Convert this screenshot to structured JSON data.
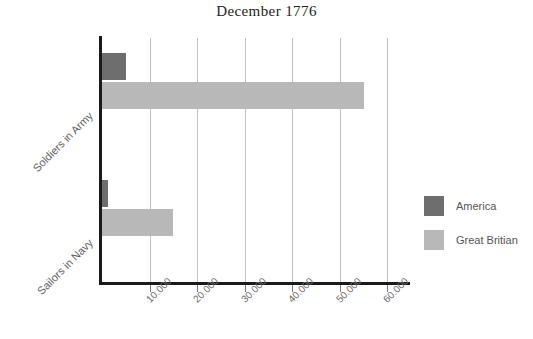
{
  "chart_data": {
    "type": "bar",
    "orientation": "horizontal",
    "title": "December 1776",
    "xlabel": "",
    "ylabel": "",
    "categories": [
      "Soldiers in Army",
      "Sailors in Navy"
    ],
    "series": [
      {
        "name": "America",
        "color": "#6e6e6e",
        "values": [
          5000,
          1200
        ]
      },
      {
        "name": "Great Britian",
        "color": "#b8b8b8",
        "values": [
          55000,
          15000
        ]
      }
    ],
    "xlim": [
      0,
      62000
    ],
    "xticks": [
      10000,
      20000,
      30000,
      40000,
      50000,
      60000
    ],
    "xtick_labels": [
      "10.000",
      "20.000",
      "30.000",
      "40.000",
      "50.000",
      "60.000"
    ],
    "grid": true,
    "grid_axis": "x",
    "legend_position": "right"
  },
  "legend": {
    "entries": [
      {
        "label": "America"
      },
      {
        "label": "Great Britian"
      }
    ]
  },
  "colors": {
    "america": "#6e6e6e",
    "britain": "#b8b8b8",
    "axis": "#1a1a1a",
    "grid": "#bfbfbf",
    "text": "#5e5e5e",
    "title": "#222222",
    "background": "#ffffff"
  }
}
